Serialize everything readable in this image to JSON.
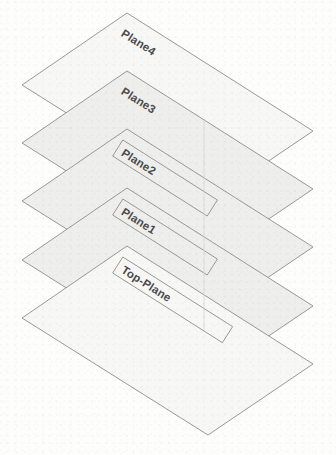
{
  "diagram": {
    "background_color": "#fdfdfc",
    "outline_color": "#8d8d8d",
    "fill_color": "#f7f7f6",
    "shaded_fill_color": "#eeeeec",
    "label_color": "#4a4a4a",
    "center_line_color": "#d8d8d6",
    "plane_count": 5,
    "vertical_offset_px": 58,
    "label_rotation_deg": 33,
    "planes": [
      {
        "id": "plane4",
        "label": "Plane4",
        "order": 1,
        "shaded": false,
        "has_label_box": false,
        "corners": {
          "top": [
            127,
            13
          ],
          "right": [
            313,
            131
          ],
          "bottom": [
            208,
            202
          ],
          "left": [
            22,
            85
          ]
        },
        "label_anchor": [
          120,
          21
        ]
      },
      {
        "id": "plane3",
        "label": "Plane3",
        "order": 2,
        "shaded": true,
        "has_label_box": false,
        "corners": {
          "top": [
            127,
            71
          ],
          "right": [
            313,
            189
          ],
          "bottom": [
            208,
            260
          ],
          "left": [
            22,
            143
          ]
        },
        "label_anchor": [
          120,
          79
        ]
      },
      {
        "id": "plane2",
        "label": "Plane2",
        "order": 3,
        "shaded": true,
        "has_label_box": true,
        "corners": {
          "top": [
            127,
            129
          ],
          "right": [
            313,
            247
          ],
          "bottom": [
            208,
            318
          ],
          "left": [
            22,
            201
          ]
        },
        "label_anchor": [
          120,
          137
        ]
      },
      {
        "id": "plane1",
        "label": "Plane1",
        "order": 4,
        "shaded": true,
        "has_label_box": true,
        "corners": {
          "top": [
            127,
            188
          ],
          "right": [
            313,
            306
          ],
          "bottom": [
            208,
            377
          ],
          "left": [
            22,
            260
          ]
        },
        "label_anchor": [
          120,
          196
        ]
      },
      {
        "id": "top-plane",
        "label": "Top-Plane",
        "order": 5,
        "shaded": false,
        "has_label_box": true,
        "corners": {
          "top": [
            127,
            246
          ],
          "right": [
            313,
            364
          ],
          "bottom": [
            208,
            435
          ],
          "left": [
            22,
            318
          ]
        },
        "label_anchor": [
          120,
          254
        ]
      }
    ],
    "center_line": {
      "x": 204,
      "y_top": 120,
      "y_bottom": 330
    }
  }
}
